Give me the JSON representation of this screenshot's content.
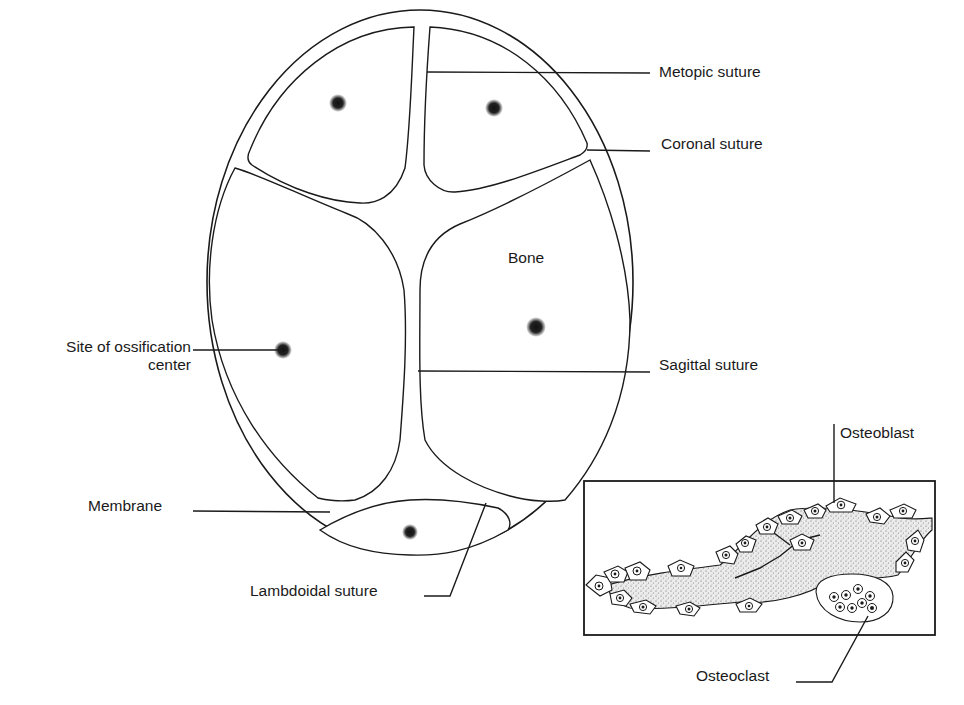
{
  "diagram": {
    "colors": {
      "ink": "#1a1a1a",
      "background": "#ffffff",
      "membrane_fill": "#f1f1f1",
      "matrix_fill": "#e6e6e6"
    },
    "labels": {
      "metopic_suture": "Metopic suture",
      "coronal_suture": "Coronal suture",
      "bone": "Bone",
      "site_of_ossification_line1": "Site of ossification",
      "site_of_ossification_line2": "center",
      "sagittal_suture": "Sagittal suture",
      "membrane": "Membrane",
      "lambdoidal_suture": "Lambdoidal suture",
      "osteoblast": "Osteoblast",
      "osteoclast": "Osteoclast"
    },
    "ossification_centers": [
      {
        "bone": "left frontal",
        "x": 338,
        "y": 103
      },
      {
        "bone": "right frontal",
        "x": 494,
        "y": 108
      },
      {
        "bone": "left parietal",
        "x": 283,
        "y": 350
      },
      {
        "bone": "right parietal",
        "x": 536,
        "y": 327
      },
      {
        "bone": "occipital",
        "x": 410,
        "y": 532
      }
    ],
    "inset": {
      "title": "Bone tissue detail",
      "box": {
        "x": 584,
        "y": 481,
        "w": 351,
        "h": 154
      }
    }
  }
}
